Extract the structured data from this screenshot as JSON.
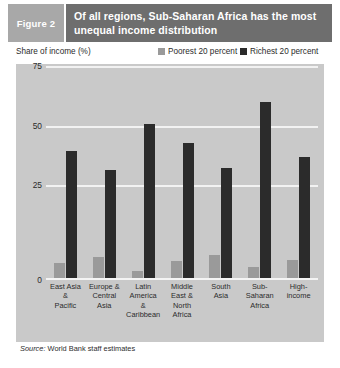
{
  "header": {
    "figure_tag": "Figure 2",
    "title": "Of all regions, Sub-Saharan Africa has the most unequal income distribution",
    "tag_bg": "#a8a8a8",
    "title_bg": "#6e6e6e"
  },
  "legend": {
    "axis_caption": "Share of income (%)",
    "entries": [
      {
        "label": "Poorest 20 percent",
        "color": "#9a9a9a"
      },
      {
        "label": "Richest 20 percent",
        "color": "#2b2b2b"
      }
    ]
  },
  "source": {
    "prefix": "Source:",
    "text": " World Bank staff estimates"
  },
  "chart_data": {
    "type": "bar",
    "title": "Of all regions, Sub-Saharan Africa has the most unequal income distribution",
    "xlabel": "",
    "ylabel": "Share of income (%)",
    "ylim": [
      0,
      80
    ],
    "yticks": [
      0,
      25,
      50,
      75
    ],
    "ytick_labels": [
      "0",
      "25",
      "50",
      "75"
    ],
    "grid": true,
    "legend_position": "top-right",
    "plot_background": "#c9c9c9",
    "categories": [
      "East Asia & Pacific",
      "Europe & Central Asia",
      "Latin America & Caribbean",
      "Middle East & North Africa",
      "South Asia",
      "Sub-Saharan Africa",
      "High-income"
    ],
    "category_label_lines": [
      [
        "East Asia",
        "&",
        "Pacific"
      ],
      [
        "Europe &",
        "Central",
        "Asia"
      ],
      [
        "Latin",
        "America",
        "& Caribbean"
      ],
      [
        "Middle",
        "East &",
        "North Africa"
      ],
      [
        "South",
        "Asia"
      ],
      [
        "Sub-Saharan",
        "Africa"
      ],
      [
        "High-",
        "income"
      ]
    ],
    "series": [
      {
        "name": "Poorest 20 percent",
        "color": "#9a9a9a",
        "values": [
          6,
          8,
          3,
          6.5,
          9,
          4.5,
          7
        ]
      },
      {
        "name": "Richest 20 percent",
        "color": "#2b2b2b",
        "values": [
          47,
          40,
          57,
          50,
          41,
          65,
          45
        ]
      }
    ]
  }
}
